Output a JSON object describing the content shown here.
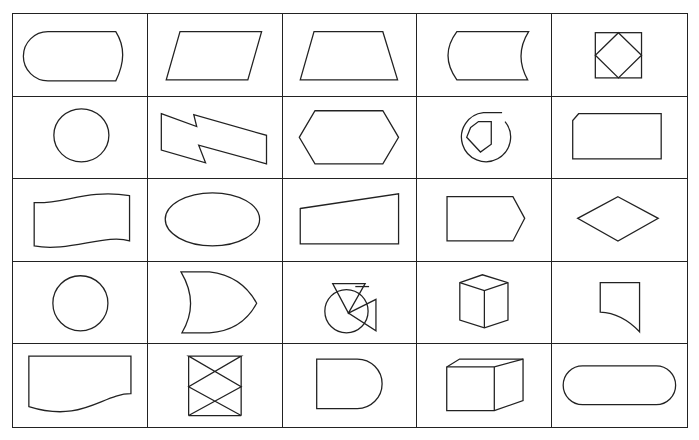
{
  "diagram": {
    "rows": 5,
    "columns": 5,
    "line_color": "#222222",
    "background": "#ffffff",
    "cells": [
      {
        "row": 1,
        "col": 1,
        "shape": "terminal-stadium-flat-right"
      },
      {
        "row": 1,
        "col": 2,
        "shape": "parallelogram"
      },
      {
        "row": 1,
        "col": 3,
        "shape": "trapezoid"
      },
      {
        "row": 1,
        "col": 4,
        "shape": "stored-data"
      },
      {
        "row": 1,
        "col": 5,
        "shape": "square-with-inscribed-diamond"
      },
      {
        "row": 2,
        "col": 1,
        "shape": "circle"
      },
      {
        "row": 2,
        "col": 2,
        "shape": "lightning-bolt"
      },
      {
        "row": 2,
        "col": 3,
        "shape": "hexagon"
      },
      {
        "row": 2,
        "col": 4,
        "shape": "circle-with-pentagon"
      },
      {
        "row": 2,
        "col": 5,
        "shape": "cut-corner-rectangle"
      },
      {
        "row": 3,
        "col": 1,
        "shape": "wavy-banner"
      },
      {
        "row": 3,
        "col": 2,
        "shape": "ellipse"
      },
      {
        "row": 3,
        "col": 3,
        "shape": "manual-input"
      },
      {
        "row": 3,
        "col": 4,
        "shape": "pentagon-arrow"
      },
      {
        "row": 3,
        "col": 5,
        "shape": "diamond"
      },
      {
        "row": 4,
        "col": 1,
        "shape": "circle"
      },
      {
        "row": 4,
        "col": 2,
        "shape": "or-gate-shield"
      },
      {
        "row": 4,
        "col": 3,
        "shape": "circle-with-triangles"
      },
      {
        "row": 4,
        "col": 4,
        "shape": "cube"
      },
      {
        "row": 4,
        "col": 5,
        "shape": "curved-bottom-quad"
      },
      {
        "row": 5,
        "col": 1,
        "shape": "document"
      },
      {
        "row": 5,
        "col": 2,
        "shape": "collate-hourglass"
      },
      {
        "row": 5,
        "col": 3,
        "shape": "delay-d-shape"
      },
      {
        "row": 5,
        "col": 4,
        "shape": "rectangular-box-3d"
      },
      {
        "row": 5,
        "col": 5,
        "shape": "stadium"
      }
    ]
  }
}
